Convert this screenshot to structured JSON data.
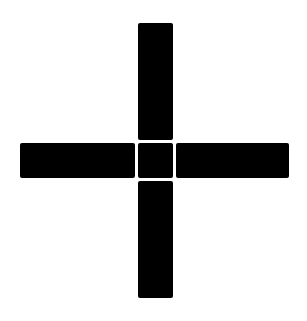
{
  "figure": {
    "type": "plus-cross-symbol",
    "background_color": "#ffffff",
    "fill_color": "#000000",
    "pieces": [
      {
        "name": "top-arm"
      },
      {
        "name": "left-arm"
      },
      {
        "name": "center-square"
      },
      {
        "name": "right-arm"
      },
      {
        "name": "bottom-arm"
      }
    ]
  }
}
